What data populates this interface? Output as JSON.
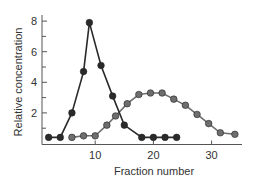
{
  "chart_data": {
    "type": "line",
    "title": "",
    "xlabel": "Fraction number",
    "ylabel": "Relative concentration",
    "xlim": [
      0,
      37
    ],
    "ylim": [
      0,
      8.5
    ],
    "x_ticks": [
      10,
      20,
      30
    ],
    "y_ticks": [
      2,
      4,
      6,
      8
    ],
    "y_minor_ticks": [
      1,
      3,
      5,
      7
    ],
    "grid": false,
    "legend": null,
    "series": [
      {
        "name": "dark series",
        "color": "#2a2a2a",
        "x": [
          2,
          4,
          6,
          8,
          9,
          11,
          13,
          15,
          18,
          20,
          22,
          24
        ],
        "y": [
          0.4,
          0.4,
          2.0,
          4.7,
          7.9,
          5.1,
          3.1,
          1.2,
          0.4,
          0.4,
          0.4,
          0.4
        ]
      },
      {
        "name": "gray series",
        "color": "#6e6e6e",
        "x": [
          6,
          8,
          10,
          12,
          13.5,
          15.5,
          17.5,
          19.5,
          21.5,
          23.5,
          25.5,
          27.5,
          29.5,
          31.5,
          34
        ],
        "y": [
          0.4,
          0.5,
          0.5,
          1.2,
          1.8,
          2.6,
          3.2,
          3.3,
          3.3,
          2.9,
          2.5,
          1.9,
          1.3,
          0.7,
          0.6
        ]
      }
    ]
  }
}
